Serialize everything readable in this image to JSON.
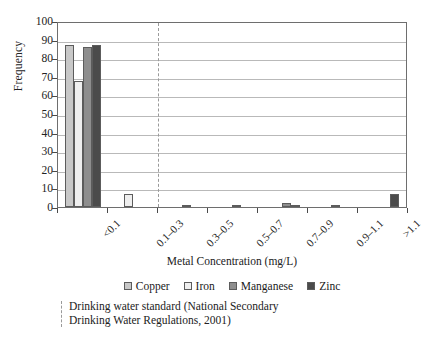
{
  "chart_data": {
    "type": "bar",
    "title": "",
    "xlabel": "Metal Concentration (mg/L)",
    "ylabel": "Frequency",
    "categories": [
      "<0.1",
      "0.1–0.3",
      "0.3–0.5",
      "0.5–0.7",
      "0.7–0.9",
      "0.9–1.1",
      ">1.1"
    ],
    "series": [
      {
        "name": "Copper",
        "color": "#c8c8c8",
        "values": [
          87,
          0,
          0,
          0,
          0,
          0,
          0
        ]
      },
      {
        "name": "Iron",
        "color": "#efefef",
        "values": [
          68,
          7,
          0,
          0,
          0,
          0,
          0
        ]
      },
      {
        "name": "Manganese",
        "color": "#8e8e8e",
        "values": [
          86,
          0,
          1,
          1,
          2,
          1,
          0
        ]
      },
      {
        "name": "Zinc",
        "color": "#4b4b4b",
        "values": [
          87,
          0,
          0,
          0,
          1,
          0,
          7
        ]
      }
    ],
    "ylim": [
      0,
      100
    ],
    "yticks": [
      0,
      10,
      20,
      30,
      40,
      50,
      60,
      70,
      80,
      90,
      100
    ],
    "grid": true,
    "legend_position": "bottom",
    "annotations": [
      {
        "type": "vertical-dashed-line",
        "after_category": "0.1–0.3",
        "color": "#9a9a9a",
        "label_line_1": "Drinking water standard (National Secondary",
        "label_line_2": "Drinking Water Regulations, 2001)"
      }
    ]
  },
  "footnote": {
    "line1": "Drinking water standard (National Secondary",
    "line2": "Drinking Water Regulations, 2001)"
  }
}
